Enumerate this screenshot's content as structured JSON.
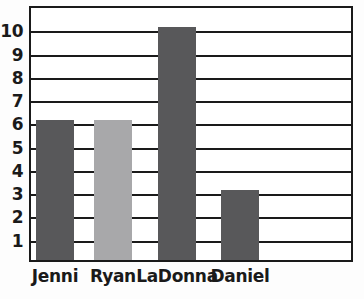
{
  "chart_data": {
    "type": "bar",
    "title": "",
    "subtitle": "",
    "xlabel": "",
    "ylabel": "",
    "categories": [
      "Jenni",
      "Ryan",
      "LaDonna",
      "Daniel"
    ],
    "values": [
      6,
      6,
      10,
      3
    ],
    "bar_colors": [
      "#58585a",
      "#a8a8aa",
      "#58585a",
      "#58585a"
    ],
    "ylim": [
      0,
      11
    ],
    "ytick_labels": [
      "1",
      "2",
      "3",
      "4",
      "5",
      "6",
      "7",
      "8",
      "9",
      "10"
    ],
    "ytick_values": [
      1,
      2,
      3,
      4,
      5,
      6,
      7,
      8,
      9,
      10
    ],
    "grid": true,
    "grid_orientation": "horizontal",
    "legend": "none",
    "annotations": []
  },
  "style": {
    "axis_color": "#1a1a1a",
    "grid_color": "#1a1a1a",
    "plot_background": "#ffffff",
    "page_background": "#fdfdfd",
    "bar_dark": "#58585a",
    "bar_light": "#a8a8aa"
  },
  "geometry": {
    "frame_left": 29,
    "frame_top": 6,
    "frame_width": 324,
    "frame_height": 256,
    "unit_px": 23.27,
    "bar_width": 38,
    "bar_centers": [
      55,
      113,
      177,
      240
    ]
  }
}
